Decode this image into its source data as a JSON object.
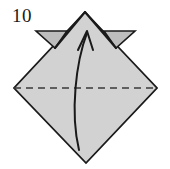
{
  "figure": {
    "kind": "origami-fold-diagram",
    "step_label": "10",
    "caption": ""
  },
  "colors": {
    "paper_fill": "#d2d2d2",
    "flap_fill": "#bdbdbd",
    "outline": "#1a1a1a",
    "crease_line": "#3a3a3a",
    "arrow": "#1a1a1a",
    "background": "#ffffff",
    "label_text": "#1a1a1a"
  },
  "chart_data": {
    "type": "diagram",
    "title": "10",
    "shapes": [
      {
        "name": "paper-diamond",
        "role": "main-paper",
        "points": "85,12 157,88 86,163 14,88",
        "fill": "#d2d2d2",
        "stroke": "#1a1a1a"
      },
      {
        "name": "left-flap",
        "role": "folded-flap",
        "points": "36,31 67,31 55,48",
        "fill": "#bdbdbd",
        "stroke": "#1a1a1a"
      },
      {
        "name": "right-flap",
        "role": "folded-flap",
        "points": "104,31 135,31 116,48",
        "fill": "#bdbdbd",
        "stroke": "#1a1a1a"
      }
    ],
    "lines": [
      {
        "name": "valley-fold-crease",
        "role": "valley-fold",
        "style": "dashed",
        "x1": 14,
        "y1": 88,
        "x2": 157,
        "y2": 88,
        "dash": "7,5",
        "stroke": "#3a3a3a"
      },
      {
        "name": "left-flap-edge",
        "role": "paper-edge",
        "style": "solid",
        "x1": 55,
        "y1": 48,
        "x2": 85,
        "y2": 12,
        "stroke": "#1a1a1a"
      },
      {
        "name": "right-flap-edge",
        "role": "paper-edge",
        "style": "solid",
        "x1": 116,
        "y1": 48,
        "x2": 85,
        "y2": 12,
        "stroke": "#1a1a1a"
      }
    ],
    "arrows": [
      {
        "name": "fold-up-arrow",
        "role": "fold-direction",
        "direction": "up",
        "path": "M 79,150 C 70,112 76,62 87,33",
        "head_at": [
          87,
          33
        ],
        "stroke": "#1a1a1a"
      }
    ],
    "annotations": [
      {
        "name": "step-number",
        "text": "10",
        "x": 12,
        "y": 6
      }
    ],
    "xlabel": "",
    "ylabel": "",
    "legend": []
  }
}
